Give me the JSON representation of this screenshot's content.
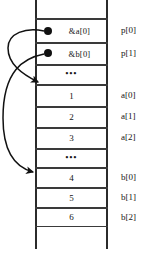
{
  "figure": {
    "caption": ""
  },
  "memory": {
    "cells": [
      {
        "id": "cell-top-pad",
        "value": "",
        "kind": "empty",
        "label": "",
        "top": 0,
        "height": 19
      },
      {
        "id": "cell-p0",
        "value": "&a[0]",
        "kind": "address",
        "label": "p[0]",
        "top": 19,
        "height": 24
      },
      {
        "id": "cell-p1",
        "value": "&b[0]",
        "kind": "address",
        "label": "p[1]",
        "top": 43,
        "height": 22
      },
      {
        "id": "cell-p-gap",
        "value": "•••",
        "kind": "ellipsis",
        "label": "",
        "top": 65,
        "height": 20
      },
      {
        "id": "cell-a0",
        "value": "1",
        "kind": "number",
        "label": "a[0]",
        "top": 85,
        "height": 22
      },
      {
        "id": "cell-a1",
        "value": "2",
        "kind": "number",
        "label": "a[1]",
        "top": 107,
        "height": 21
      },
      {
        "id": "cell-a2",
        "value": "3",
        "kind": "number",
        "label": "a[2]",
        "top": 128,
        "height": 21
      },
      {
        "id": "cell-ab-gap",
        "value": "•••",
        "kind": "ellipsis",
        "label": "",
        "top": 149,
        "height": 19
      },
      {
        "id": "cell-b0",
        "value": "4",
        "kind": "number",
        "label": "b[0]",
        "top": 168,
        "height": 20
      },
      {
        "id": "cell-b1",
        "value": "5",
        "kind": "number",
        "label": "b[1]",
        "top": 188,
        "height": 20
      },
      {
        "id": "cell-b2",
        "value": "6",
        "kind": "number",
        "label": "b[2]",
        "top": 208,
        "height": 19
      }
    ]
  },
  "pointers": [
    {
      "id": "pointer-p0",
      "from_cell": "cell-p0",
      "to_cell": "cell-a0",
      "value": "&a[0]"
    },
    {
      "id": "pointer-p1",
      "from_cell": "cell-p1",
      "to_cell": "cell-b0",
      "value": "&b[0]"
    }
  ],
  "colors": {
    "line": "#2b2b2b",
    "cell_border": "#3a3a3a",
    "bullet": "#111111",
    "text": "#141414",
    "background": "#ffffff"
  }
}
